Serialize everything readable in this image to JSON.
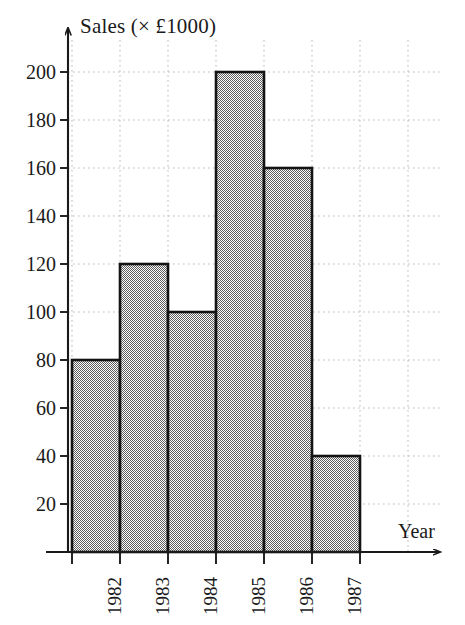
{
  "chart_data": {
    "type": "bar",
    "title": "",
    "xlabel": "Year",
    "ylabel": "Sales (× £1000)",
    "categories": [
      "1982",
      "1983",
      "1984",
      "1985",
      "1986",
      "1987"
    ],
    "values": [
      80,
      120,
      100,
      200,
      160,
      40
    ],
    "series": [
      {
        "name": "Sales",
        "values": [
          80,
          120,
          100,
          200,
          160,
          40
        ]
      }
    ],
    "ylim": [
      0,
      200
    ],
    "xlim": [
      0,
      6
    ],
    "y_ticks": [
      20,
      40,
      60,
      80,
      100,
      120,
      140,
      160,
      180,
      200
    ],
    "y_tick_labels": [
      "20",
      "40",
      "60",
      "80",
      "100",
      "120",
      "140",
      "160",
      "180",
      "200"
    ],
    "y_tick_step": 20,
    "grid": true,
    "grid_style": "dotted",
    "legend": false,
    "legend_position": "none",
    "bar_gap": 0,
    "bar_fill": "#a8a8a8",
    "bar_fill_pattern": "halftone-checker",
    "bar_edge_color": "#141414",
    "axis_color": "#1a1a1a",
    "grid_color": "#b9b9b9",
    "background": "#ffffff",
    "y_axis_arrow": true,
    "x_axis_arrow": true,
    "x_tick_label_rotation": -90
  },
  "axes": {
    "y_title": "Sales (× £1000)",
    "x_title": "Year"
  }
}
